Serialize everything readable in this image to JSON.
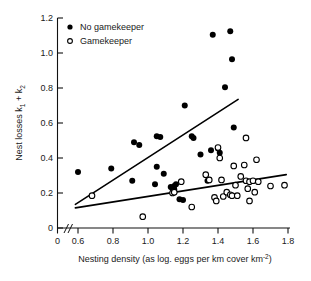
{
  "chart_data": {
    "type": "scatter",
    "title": "",
    "xlabel": "Nesting density (as log. eggs per km cover km-2)",
    "xlabel_main": "Nesting density (as log. eggs per km cover km",
    "xlabel_sup": "-2",
    "xlabel_tail": ")",
    "ylabel_main": "Nest losses k",
    "ylabel_sub1": "1",
    "ylabel_mid": " + k",
    "ylabel_sub2": "2",
    "xlim": [
      0.55,
      1.82
    ],
    "ylim": [
      0,
      1.2
    ],
    "axis_break": true,
    "axis_break_symbol": "//",
    "grid": false,
    "xticks": [
      0,
      0.6,
      0.8,
      1.0,
      1.2,
      1.4,
      1.6,
      1.8
    ],
    "xtick_labels": [
      "0",
      "0.6",
      "0.8",
      "1.0",
      "1.2",
      "1.4",
      "1.6",
      "1.8"
    ],
    "yticks": [
      0,
      0.2,
      0.4,
      0.6,
      0.8,
      1.0,
      1.2
    ],
    "ytick_labels": [
      "0",
      "0.2",
      "0.4",
      "0.6",
      "0.8",
      "1.0",
      "1.2"
    ],
    "legend_position": "top-left-inside",
    "series": [
      {
        "name": "No gamekeeper",
        "marker": "filled-circle",
        "color": "#000000",
        "points": [
          [
            0.6,
            0.32
          ],
          [
            0.79,
            0.34
          ],
          [
            0.92,
            0.49
          ],
          [
            0.95,
            0.475
          ],
          [
            0.91,
            0.27
          ],
          [
            1.05,
            0.525
          ],
          [
            1.07,
            0.52
          ],
          [
            1.05,
            0.35
          ],
          [
            1.04,
            0.25
          ],
          [
            1.09,
            0.31
          ],
          [
            1.13,
            0.235
          ],
          [
            1.14,
            0.225
          ],
          [
            1.15,
            0.24
          ],
          [
            1.15,
            0.22
          ],
          [
            1.16,
            0.25
          ],
          [
            1.18,
            0.165
          ],
          [
            1.2,
            0.16
          ],
          [
            1.21,
            0.7
          ],
          [
            1.25,
            0.525
          ],
          [
            1.26,
            0.515
          ],
          [
            1.3,
            0.42
          ],
          [
            1.34,
            0.27
          ],
          [
            1.36,
            0.445
          ],
          [
            1.37,
            1.105
          ],
          [
            1.4,
            0.455
          ],
          [
            1.41,
            0.43
          ],
          [
            1.44,
            0.805
          ],
          [
            1.47,
            1.125
          ],
          [
            1.48,
            0.965
          ],
          [
            1.49,
            0.575
          ]
        ]
      },
      {
        "name": "Gamekeeper",
        "marker": "open-circle",
        "color": "#000000",
        "points": [
          [
            0.68,
            0.185
          ],
          [
            0.97,
            0.065
          ],
          [
            1.14,
            0.2
          ],
          [
            1.15,
            0.205
          ],
          [
            1.19,
            0.265
          ],
          [
            1.25,
            0.12
          ],
          [
            1.33,
            0.305
          ],
          [
            1.35,
            0.275
          ],
          [
            1.38,
            0.175
          ],
          [
            1.39,
            0.155
          ],
          [
            1.4,
            0.46
          ],
          [
            1.41,
            0.4
          ],
          [
            1.42,
            0.275
          ],
          [
            1.43,
            0.18
          ],
          [
            1.45,
            0.205
          ],
          [
            1.47,
            0.19
          ],
          [
            1.48,
            0.185
          ],
          [
            1.49,
            0.355
          ],
          [
            1.5,
            0.245
          ],
          [
            1.51,
            0.185
          ],
          [
            1.53,
            0.295
          ],
          [
            1.55,
            0.36
          ],
          [
            1.56,
            0.515
          ],
          [
            1.56,
            0.27
          ],
          [
            1.57,
            0.225
          ],
          [
            1.58,
            0.155
          ],
          [
            1.58,
            0.265
          ],
          [
            1.6,
            0.27
          ],
          [
            1.61,
            0.205
          ],
          [
            1.62,
            0.39
          ],
          [
            1.63,
            0.265
          ],
          [
            1.7,
            0.24
          ],
          [
            1.78,
            0.245
          ]
        ]
      }
    ],
    "fit_lines": [
      {
        "name": "No gamekeeper regression",
        "for_series": "No gamekeeper",
        "x": [
          0.585,
          1.515
        ],
        "y": [
          0.135,
          0.735
        ]
      },
      {
        "name": "Gamekeeper regression",
        "for_series": "Gamekeeper",
        "x": [
          0.585,
          1.79
        ],
        "y": [
          0.115,
          0.305
        ]
      }
    ]
  },
  "legend": {
    "entries": [
      {
        "label": "No gamekeeper",
        "marker": "filled-circle"
      },
      {
        "label": "Gamekeeper",
        "marker": "open-circle"
      }
    ]
  }
}
